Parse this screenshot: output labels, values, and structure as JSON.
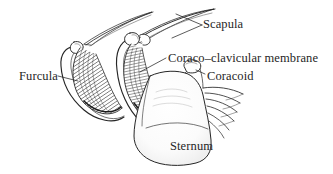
{
  "figure": {
    "style": "pen-and-ink hatched anatomical illustration",
    "background_color": "#ffffff",
    "ink_color": "#262626"
  },
  "labels": {
    "scapula": "Scapula",
    "coraco_clavicular_membrane": "Coraco–clavicular membrane",
    "coracoid": "Coracoid",
    "furcula": "Furcula",
    "sternum": "Sternum"
  },
  "structures": [
    {
      "name": "scapula-left",
      "label": "Scapula"
    },
    {
      "name": "scapula-right",
      "label": "Scapula"
    },
    {
      "name": "furcula",
      "label": "Furcula"
    },
    {
      "name": "coracoid",
      "label": "Coracoid"
    },
    {
      "name": "coraco-clavicular-membrane",
      "label": "Coraco–clavicular membrane"
    },
    {
      "name": "sternum",
      "label": "Sternum"
    },
    {
      "name": "ribs",
      "label": ""
    }
  ]
}
